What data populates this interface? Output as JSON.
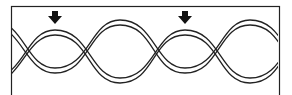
{
  "diagram": {
    "type": "twisted-strands",
    "frame": {
      "x": 11,
      "y": 6,
      "width": 268,
      "height": 95
    },
    "arrows": [
      {
        "label": "crossing-marker-1",
        "x": 55,
        "y": 12
      },
      {
        "label": "crossing-marker-2",
        "x": 185,
        "y": 12
      }
    ],
    "colors": {
      "line": "#1a1a1a",
      "background": "#ffffff"
    }
  }
}
